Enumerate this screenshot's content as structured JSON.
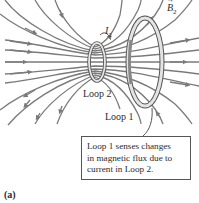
{
  "figure": {
    "panel_label": "(a)",
    "labels": {
      "loop2": "Loop 2",
      "loop1": "Loop 1",
      "current": {
        "symbol": "I",
        "subscript": "2"
      },
      "field": {
        "symbol": "B",
        "subscript": "2",
        "vector_arrow": "→"
      }
    },
    "callout": {
      "lines": [
        "Loop 1 senses changes",
        "in magnetic flux due to",
        "current in Loop 2."
      ]
    },
    "colors": {
      "field_line": "#7a7a7a",
      "loop_outline": "#555555",
      "loop_fill": "#d9d9d9",
      "text": "#2b2b2b",
      "background": "#ffffff"
    }
  }
}
